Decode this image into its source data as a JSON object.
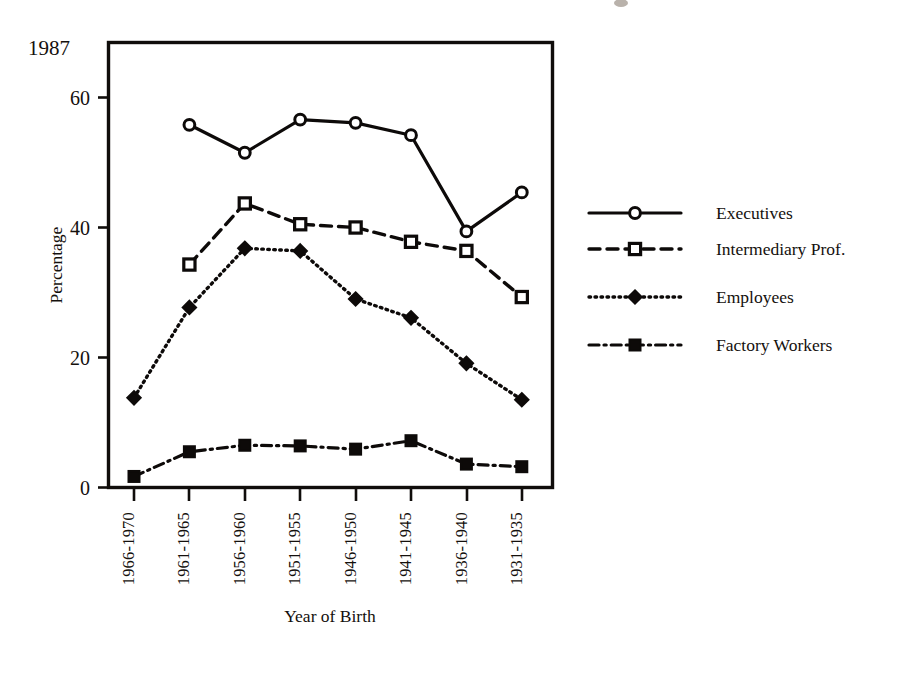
{
  "figure": {
    "corner_year_label": "1987",
    "y_axis_title": "Percentage",
    "x_axis_title": "Year of Birth"
  },
  "chart_data": {
    "type": "line",
    "title": "1987",
    "xlabel": "Year of Birth",
    "ylabel": "Percentage",
    "categories": [
      "1966-1970",
      "1961-1965",
      "1956-1960",
      "1951-1955",
      "1946-1950",
      "1941-1945",
      "1936-1940",
      "1931-1935"
    ],
    "ylim": [
      0,
      65
    ],
    "yticks": [
      0,
      20,
      40,
      60
    ],
    "ytick_labels": [
      "0",
      "20",
      "40",
      "60"
    ],
    "grid": false,
    "legend_position": "right",
    "series": [
      {
        "name": "Executives",
        "linestyle": "solid",
        "marker": "open-circle",
        "values": [
          null,
          55.8,
          51.5,
          56.6,
          56.1,
          54.2,
          39.4,
          45.4
        ]
      },
      {
        "name": "Intermediary Prof.",
        "linestyle": "dashed",
        "marker": "open-square",
        "values": [
          null,
          34.3,
          43.7,
          40.5,
          40.0,
          37.8,
          36.4,
          29.3
        ]
      },
      {
        "name": "Employees",
        "linestyle": "dotted",
        "marker": "filled-diamond",
        "values": [
          13.8,
          27.7,
          36.8,
          36.4,
          29.0,
          26.1,
          19.1,
          13.5
        ]
      },
      {
        "name": "Factory Workers",
        "linestyle": "dash-dot",
        "marker": "filled-square",
        "values": [
          1.7,
          5.5,
          6.5,
          6.4,
          5.9,
          7.2,
          3.6,
          3.2
        ]
      }
    ]
  },
  "legend": {
    "entries": [
      {
        "label": "Executives"
      },
      {
        "label": "Intermediary Prof."
      },
      {
        "label": "Employees"
      },
      {
        "label": "Factory Workers"
      }
    ]
  }
}
